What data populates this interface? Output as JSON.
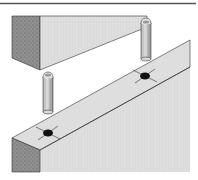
{
  "figure": {
    "parts": [
      {
        "name": "upper-board",
        "label": "Upper board"
      },
      {
        "name": "lower-board",
        "label": "Lower board"
      },
      {
        "name": "dowel-left",
        "label": "Dowel"
      },
      {
        "name": "dowel-right",
        "label": "Dowel"
      },
      {
        "name": "hole-left",
        "label": "Dowel hole"
      },
      {
        "name": "hole-right",
        "label": "Dowel hole"
      }
    ],
    "colors": {
      "border": "#555555",
      "face_light": "#e6e6e6",
      "face_mid": "#d2d2d2",
      "end_grain": "#8f8f8f",
      "outline": "#333333",
      "hole": "#111111"
    }
  }
}
